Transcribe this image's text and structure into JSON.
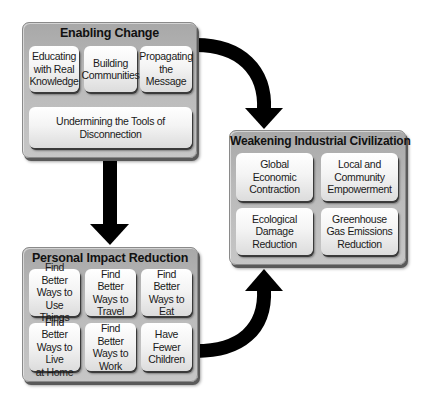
{
  "diagram": {
    "enabling_change": {
      "title": "Enabling Change",
      "items": [
        {
          "label": "Educating\nwith Real\nKnowledge"
        },
        {
          "label": "Building\nCommunities"
        },
        {
          "label": "Propagating\nthe Message"
        },
        {
          "label": "Undermining the Tools of Disconnection"
        }
      ]
    },
    "weakening_industrial_civilization": {
      "title": "Weakening Industrial Civilization",
      "items": [
        {
          "label": "Global Economic\nContraction"
        },
        {
          "label": "Local and\nCommunity\nEmpowerment"
        },
        {
          "label": "Ecological\nDamage\nReduction"
        },
        {
          "label": "Greenhouse\nGas Emissions\nReduction"
        }
      ]
    },
    "personal_impact_reduction": {
      "title": "Personal Impact Reduction",
      "items": [
        {
          "label": "Find Better\nWays to Use\nThings"
        },
        {
          "label": "Find Better\nWays to\nTravel"
        },
        {
          "label": "Find Better\nWays to\nEat"
        },
        {
          "label": "Find Better\nWays to Live\nat Home"
        },
        {
          "label": "Find Better\nWays to\nWork"
        },
        {
          "label": "Have\nFewer\nChildren"
        }
      ]
    },
    "arrows": [
      {
        "from": "Enabling Change",
        "to": "Weakening Industrial Civilization",
        "shape": "curved"
      },
      {
        "from": "Enabling Change",
        "to": "Personal Impact Reduction",
        "shape": "straight"
      },
      {
        "from": "Personal Impact Reduction",
        "to": "Weakening Industrial Civilization",
        "shape": "curved"
      }
    ],
    "colors": {
      "group_fill": "#b5b5b5",
      "card_fill": "#f2f2f2",
      "arrow": "#000000",
      "text": "#111111"
    }
  }
}
